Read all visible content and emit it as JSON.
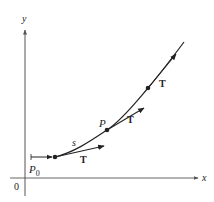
{
  "diagram": {
    "axes": {
      "x_label": "x",
      "y_label": "y",
      "origin_label": "0",
      "axis_color": "#555555"
    },
    "curve": {
      "color": "#222222",
      "description": "smooth increasing curve from P0 rising up to the right"
    },
    "points": [
      {
        "name": "start-point",
        "label": "P",
        "subscript": "0"
      },
      {
        "name": "point-p",
        "label": "P"
      },
      {
        "name": "point-upper",
        "label": ""
      }
    ],
    "arc_length_label": "s",
    "tangent_label": "T",
    "tangent_vectors": [
      {
        "at": "start-point",
        "label": "T"
      },
      {
        "at": "point-p",
        "label": "T"
      },
      {
        "at": "point-upper",
        "label": "T"
      }
    ]
  }
}
